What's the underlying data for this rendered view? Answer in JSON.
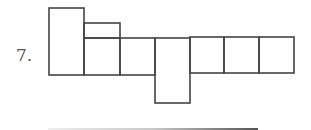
{
  "problem": {
    "number_label": "7."
  },
  "diagram": {
    "stroke_color": "#444444",
    "stroke_width": 1.6,
    "shapes": [
      {
        "id": "tall-rect",
        "x": 49,
        "y": 8,
        "w": 35,
        "h": 67
      },
      {
        "id": "top-flap",
        "x": 84,
        "y": 23,
        "w": 36,
        "h": 15
      },
      {
        "id": "strip-cell-1",
        "x": 84,
        "y": 38,
        "w": 36,
        "h": 37
      },
      {
        "id": "strip-cell-2",
        "x": 120,
        "y": 38,
        "w": 35,
        "h": 37
      },
      {
        "id": "drop-rect",
        "x": 155,
        "y": 38,
        "w": 35,
        "h": 65
      },
      {
        "id": "strip-cell-3",
        "x": 190,
        "y": 37,
        "w": 34,
        "h": 36
      },
      {
        "id": "strip-cell-4",
        "x": 224,
        "y": 37,
        "w": 35,
        "h": 36
      },
      {
        "id": "strip-cell-5",
        "x": 259,
        "y": 37,
        "w": 35,
        "h": 36
      }
    ]
  },
  "answer_line": {
    "gradient": [
      "#eeeeee",
      "#c8c8c8",
      "#555555"
    ]
  }
}
